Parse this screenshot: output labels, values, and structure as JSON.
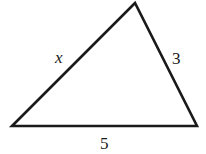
{
  "diagram": {
    "type": "triangle",
    "stroke_color": "#1a1a1a",
    "background": "#ffffff",
    "vertices": {
      "bottom_left": [
        12,
        126
      ],
      "top": [
        135,
        3
      ],
      "bottom_right": [
        197,
        126
      ]
    },
    "sides": [
      {
        "id": "left",
        "label": "x",
        "italic": true,
        "pos": [
          60,
          63
        ]
      },
      {
        "id": "right",
        "label": "3",
        "italic": false,
        "pos": [
          174,
          64
        ]
      },
      {
        "id": "bottom",
        "label": "5",
        "italic": false,
        "pos": [
          100,
          148
        ]
      }
    ]
  }
}
